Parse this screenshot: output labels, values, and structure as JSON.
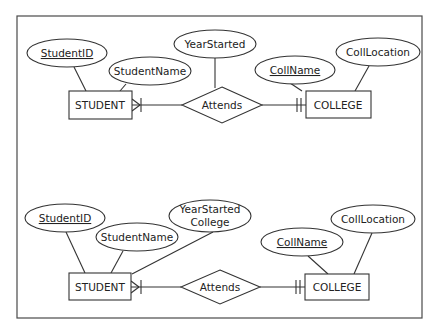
{
  "diagram": {
    "type": "ER diagram (crow's foot notation)",
    "top": {
      "entities": [
        {
          "id": "student",
          "label": "STUDENT"
        },
        {
          "id": "college",
          "label": "COLLEGE"
        }
      ],
      "relationship": {
        "label": "Attends",
        "student_side": "one-or-many",
        "college_side": "one-and-only-one"
      },
      "attributes": [
        {
          "label": "StudentID",
          "of": "STUDENT",
          "key": true
        },
        {
          "label": "StudentName",
          "of": "STUDENT",
          "key": false
        },
        {
          "label": "YearStarted",
          "of": "Attends",
          "key": false
        },
        {
          "label": "CollName",
          "of": "COLLEGE",
          "key": true
        },
        {
          "label": "CollLocation",
          "of": "COLLEGE",
          "key": false
        }
      ]
    },
    "bottom": {
      "entities": [
        {
          "id": "student",
          "label": "STUDENT"
        },
        {
          "id": "college",
          "label": "COLLEGE"
        }
      ],
      "relationship": {
        "label": "Attends",
        "student_side": "one-or-many",
        "college_side": "one-and-only-one"
      },
      "attributes": [
        {
          "label": "StudentID",
          "of": "STUDENT",
          "key": true
        },
        {
          "label": "StudentName",
          "of": "STUDENT",
          "key": false
        },
        {
          "label_line1": "YearStarted",
          "label_line2": "College",
          "of": "STUDENT",
          "key": false
        },
        {
          "label": "CollName",
          "of": "COLLEGE",
          "key": true
        },
        {
          "label": "CollLocation",
          "of": "COLLEGE",
          "key": false
        }
      ]
    }
  }
}
